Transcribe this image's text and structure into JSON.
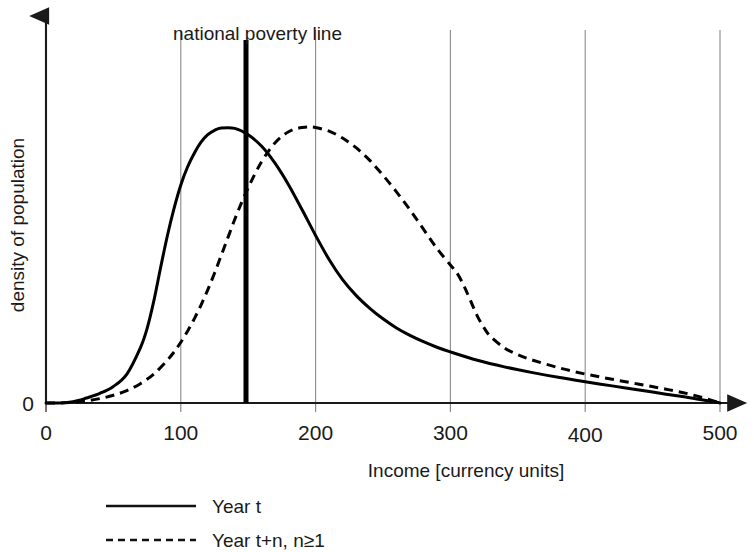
{
  "chart_data": {
    "type": "line",
    "title": "",
    "xlabel": "Income [currency units]",
    "ylabel": "density of population",
    "xlim": [
      0,
      500
    ],
    "ylim": [
      0,
      1
    ],
    "xticks": [
      0,
      100,
      200,
      300,
      400,
      500
    ],
    "xtick_labels": [
      "0",
      "100",
      "200",
      "300",
      "400",
      "500"
    ],
    "yticks": [
      0
    ],
    "ytick_labels": [
      "0"
    ],
    "grid": true,
    "grid_axis": "x",
    "legend_position": "bottom-left",
    "annotations": [
      {
        "name": "national-poverty-line",
        "label": "national poverty line",
        "x": 150,
        "style": "vertical-thick-line",
        "color": "#000000"
      }
    ],
    "series": [
      {
        "name": "Year t",
        "style": "solid",
        "color": "#000000",
        "x": [
          0,
          10,
          20,
          25,
          30,
          40,
          50,
          60,
          70,
          75,
          80,
          85,
          90,
          95,
          100,
          105,
          110,
          115,
          120,
          125,
          130,
          140,
          150,
          160,
          170,
          180,
          190,
          200,
          210,
          220,
          230,
          240,
          250,
          260,
          270,
          280,
          290,
          300,
          320,
          340,
          360,
          380,
          400,
          420,
          440,
          460,
          480,
          500
        ],
        "y": [
          0.0,
          0.0,
          0.005,
          0.01,
          0.018,
          0.035,
          0.06,
          0.105,
          0.2,
          0.27,
          0.37,
          0.49,
          0.605,
          0.705,
          0.79,
          0.855,
          0.905,
          0.945,
          0.972,
          0.988,
          0.996,
          0.995,
          0.972,
          0.93,
          0.868,
          0.79,
          0.7,
          0.607,
          0.52,
          0.447,
          0.39,
          0.344,
          0.305,
          0.272,
          0.245,
          0.222,
          0.202,
          0.185,
          0.155,
          0.131,
          0.111,
          0.093,
          0.077,
          0.062,
          0.047,
          0.032,
          0.017,
          0.0
        ]
      },
      {
        "name": "Year t+n, n≥1",
        "style": "dashed",
        "color": "#000000",
        "x": [
          0,
          10,
          20,
          30,
          40,
          50,
          60,
          70,
          80,
          90,
          95,
          100,
          105,
          110,
          115,
          120,
          125,
          130,
          135,
          140,
          145,
          150,
          155,
          160,
          165,
          170,
          175,
          180,
          185,
          190,
          195,
          200,
          210,
          220,
          230,
          240,
          250,
          260,
          270,
          280,
          290,
          300,
          305,
          310,
          315,
          320,
          325,
          330,
          340,
          350,
          360,
          380,
          400,
          420,
          440,
          460,
          480,
          500
        ],
        "y": [
          0.0,
          0.0,
          0.003,
          0.008,
          0.016,
          0.028,
          0.045,
          0.07,
          0.105,
          0.155,
          0.185,
          0.22,
          0.26,
          0.305,
          0.355,
          0.41,
          0.47,
          0.535,
          0.6,
          0.665,
          0.725,
          0.78,
          0.83,
          0.875,
          0.912,
          0.943,
          0.966,
          0.983,
          0.993,
          0.998,
          1.0,
          0.998,
          0.985,
          0.96,
          0.925,
          0.88,
          0.825,
          0.765,
          0.7,
          0.63,
          0.56,
          0.5,
          0.47,
          0.425,
          0.37,
          0.315,
          0.272,
          0.24,
          0.2,
          0.175,
          0.157,
          0.128,
          0.105,
          0.086,
          0.068,
          0.05,
          0.029,
          0.0
        ]
      }
    ]
  },
  "axes": {
    "y_axis_label": "density of population",
    "y_origin_label": "0",
    "x_axis_label": "Income [currency units]",
    "x_tick_labels": [
      "0",
      "100",
      "200",
      "300",
      "400",
      "500"
    ]
  },
  "poverty_line": {
    "label": "national poverty line"
  },
  "legend": {
    "entries": [
      {
        "label": "Year t",
        "style": "solid"
      },
      {
        "label": "Year t+n, n≥1",
        "style": "dashed"
      }
    ]
  },
  "colors": {
    "curve": "#111111",
    "grid": "#8a8a8a",
    "axis": "#1a1a1a",
    "poverty_line": "#000000",
    "background": "#ffffff"
  }
}
